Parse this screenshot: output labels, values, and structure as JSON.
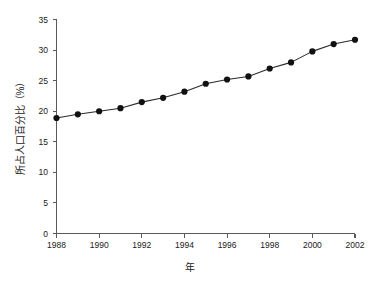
{
  "chart_data": {
    "type": "line",
    "title": "",
    "subtitle": "",
    "xlabel": "年",
    "ylabel": "所占人口百分比（%）",
    "x": [
      1988,
      1989,
      1990,
      1991,
      1992,
      1993,
      1994,
      1995,
      1996,
      1997,
      1998,
      1999,
      2000,
      2001,
      2002
    ],
    "values": [
      18.9,
      19.5,
      20.0,
      20.5,
      21.5,
      22.2,
      23.2,
      24.5,
      25.2,
      25.7,
      27.0,
      28.0,
      29.8,
      31.0,
      31.7
    ],
    "series": [
      {
        "name": "所占人口百分比",
        "values": [
          18.9,
          19.5,
          20.0,
          20.5,
          21.5,
          22.2,
          23.2,
          24.5,
          25.2,
          25.7,
          27.0,
          28.0,
          29.8,
          31.0,
          31.7
        ]
      }
    ],
    "xlim": [
      1988,
      2002
    ],
    "ylim": [
      0,
      35
    ],
    "xticks": [
      1988,
      1990,
      1992,
      1994,
      1996,
      1998,
      2000,
      2002
    ],
    "xticklabels": [
      "1988",
      "1990",
      "1992",
      "1994",
      "1996",
      "1998",
      "2000",
      "2002"
    ],
    "yticks": [
      0,
      5,
      10,
      15,
      20,
      25,
      30,
      35
    ],
    "yticklabels": [
      "0",
      "5",
      "10",
      "15",
      "20",
      "25",
      "30",
      "35"
    ],
    "grid": false,
    "legend": false,
    "legend_position": "none",
    "marker": "filled-circle",
    "line_color": "#2b2b2b",
    "marker_color": "#111111",
    "axis_color": "#5a5a5a",
    "background_color": "#ffffff",
    "annotations": []
  }
}
